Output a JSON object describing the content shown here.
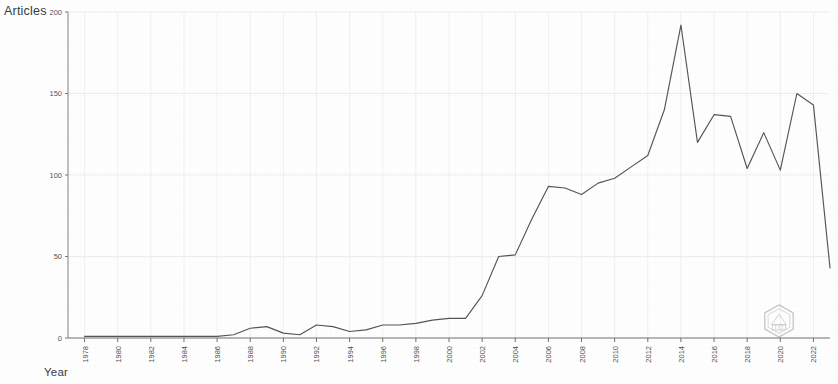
{
  "figure": {
    "ylabel": "Articles",
    "xlabel": "Year",
    "watermark": "hexagon-seal-watermark"
  },
  "chart_data": {
    "type": "line",
    "title": "",
    "xlabel": "Year",
    "ylabel": "Articles",
    "xlim": [
      1977,
      2023
    ],
    "ylim": [
      0,
      200
    ],
    "yticks": [
      0,
      50,
      100,
      150,
      200
    ],
    "ytick_labels": [
      "0",
      "50",
      "100",
      "150",
      "200"
    ],
    "xticks": [
      1978,
      1980,
      1982,
      1984,
      1986,
      1988,
      1990,
      1992,
      1994,
      1996,
      1998,
      2000,
      2002,
      2004,
      2006,
      2008,
      2010,
      2012,
      2014,
      2016,
      2018,
      2020,
      2022
    ],
    "xtick_labels": [
      "1978",
      "1980",
      "1982",
      "1984",
      "1986",
      "1988",
      "1990",
      "1992",
      "1994",
      "1996",
      "1998",
      "2000",
      "2002",
      "2004",
      "2006",
      "2008",
      "2010",
      "2012",
      "2014",
      "2016",
      "2018",
      "2020",
      "2022"
    ],
    "grid": true,
    "legend": null,
    "line_color": "#555555",
    "x": [
      1978,
      1979,
      1980,
      1981,
      1982,
      1983,
      1984,
      1985,
      1986,
      1987,
      1988,
      1989,
      1990,
      1991,
      1992,
      1993,
      1994,
      1995,
      1996,
      1997,
      1998,
      1999,
      2000,
      2001,
      2002,
      2003,
      2004,
      2005,
      2006,
      2007,
      2008,
      2009,
      2010,
      2011,
      2012,
      2013,
      2014,
      2015,
      2016,
      2017,
      2018,
      2019,
      2020,
      2021,
      2022,
      2023
    ],
    "values": [
      1,
      1,
      1,
      1,
      1,
      1,
      1,
      1,
      1,
      2,
      6,
      7,
      3,
      2,
      8,
      7,
      4,
      5,
      8,
      8,
      9,
      11,
      12,
      12,
      26,
      50,
      51,
      73,
      93,
      92,
      88,
      95,
      98,
      105,
      112,
      140,
      192,
      120,
      137,
      136,
      104,
      126,
      103,
      150,
      143,
      43
    ],
    "series": [
      {
        "name": "Articles",
        "values": [
          1,
          1,
          1,
          1,
          1,
          1,
          1,
          1,
          1,
          2,
          6,
          7,
          3,
          2,
          8,
          7,
          4,
          5,
          8,
          8,
          9,
          11,
          12,
          12,
          26,
          50,
          51,
          73,
          93,
          92,
          88,
          95,
          98,
          105,
          112,
          140,
          192,
          120,
          137,
          136,
          104,
          126,
          103,
          150,
          143,
          43
        ]
      }
    ]
  }
}
